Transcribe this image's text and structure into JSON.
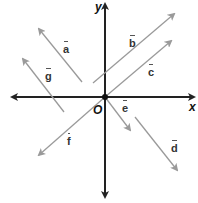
{
  "diagram": {
    "axes": {
      "x_label": "x",
      "y_label": "y",
      "origin_label": "O",
      "color": "#222222"
    },
    "vector_color": "#9a9a9a",
    "vectors": [
      {
        "name": "a",
        "label": "a",
        "tail": [
          82,
          82
        ],
        "head": [
          39,
          29
        ]
      },
      {
        "name": "b",
        "label": "b",
        "tail": [
          93,
          83
        ],
        "head": [
          174,
          14
        ]
      },
      {
        "name": "c",
        "label": "c",
        "tail": [
          105,
          98
        ],
        "head": [
          171,
          41
        ]
      },
      {
        "name": "d",
        "label": "d",
        "tail": [
          135,
          117
        ],
        "head": [
          177,
          170
        ]
      },
      {
        "name": "e",
        "label": "e",
        "tail": [
          105,
          98
        ],
        "head": [
          130,
          130
        ]
      },
      {
        "name": "f",
        "label": "f",
        "tail": [
          105,
          98
        ],
        "head": [
          39,
          155
        ]
      },
      {
        "name": "g",
        "label": "g",
        "tail": [
          64,
          112
        ],
        "head": [
          23,
          59
        ]
      }
    ]
  }
}
